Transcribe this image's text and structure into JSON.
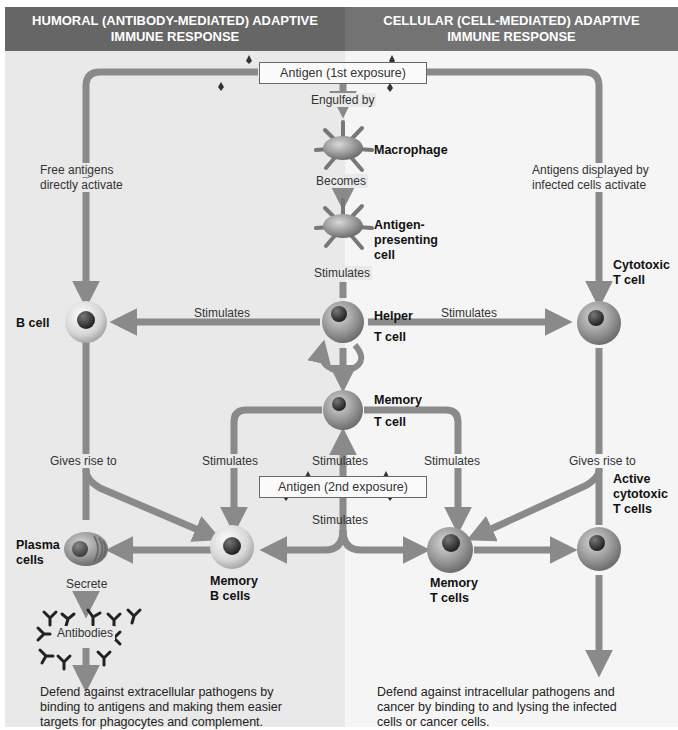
{
  "headers": {
    "left": "HUMORAL (ANTIBODY-MEDIATED) ADAPTIVE\nIMMUNE RESPONSE",
    "left_line1": "HUMORAL (ANTIBODY-MEDIATED) ADAPTIVE",
    "left_line2": "IMMUNE RESPONSE",
    "right_line1": "CELLULAR (CELL-MEDIATED) ADAPTIVE",
    "right_line2": "IMMUNE RESPONSE"
  },
  "colors": {
    "header_bg": "#6b6b6b",
    "left_panel_bg": "#e9e9e9",
    "right_panel_bg": "#f5f5f5",
    "arrow": "#8a8a8a",
    "cell_body": "#9a9a9a",
    "nucleus": "#3a3a3a"
  },
  "antigen_boxes": {
    "first": "Antigen (1st exposure)",
    "second": "Antigen (2nd exposure)"
  },
  "cells": {
    "macrophage": "Macrophage",
    "apc_line1": "Antigen-",
    "apc_line2": "presenting",
    "apc_line3": "cell",
    "b_cell": "B cell",
    "helper_line1": "Helper",
    "helper_line2": "T cell",
    "cytotoxic_line1": "Cytotoxic",
    "cytotoxic_line2": "T cell",
    "memory_t_line1": "Memory",
    "memory_t_line2": "T cell",
    "plasma_line1": "Plasma",
    "plasma_line2": "cells",
    "memory_b_line1": "Memory",
    "memory_b_line2": "B cells",
    "memory_ts_line1": "Memory",
    "memory_ts_line2": "T cells",
    "active_line1": "Active",
    "active_line2": "cytotoxic",
    "active_line3": "T cells"
  },
  "edges": {
    "engulfed_by": "Engulfed by",
    "becomes": "Becomes",
    "stimulates_apc": "Stimulates",
    "free_antigens_line1": "Free antigens",
    "free_antigens_line2": "directly activate",
    "displayed_line1": "Antigens displayed by",
    "displayed_line2": "infected cells activate",
    "stim_to_b": "Stimulates",
    "stim_to_cyto": "Stimulates",
    "gives_rise_left": "Gives rise to",
    "gives_rise_right": "Gives rise to",
    "stim_mem_b": "Stimulates",
    "stim_mem_t_up": "Stimulates",
    "stim_mem_ts": "Stimulates",
    "stim_below_antigen2": "Stimulates",
    "secrete": "Secrete",
    "antibodies": "Antibodies"
  },
  "footer": {
    "left_line1": "Defend against extracellular pathogens by",
    "left_line2": "binding to antigens and making them easier",
    "left_line3": "targets for phagocytes and complement.",
    "right_line1": "Defend against intracellular pathogens and",
    "right_line2": "cancer by binding to and lysing the infected",
    "right_line3": "cells or cancer cells."
  }
}
